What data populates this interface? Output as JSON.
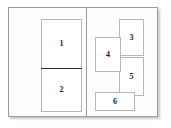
{
  "diagram": {
    "type": "layout-wireframe",
    "title": "",
    "frame": {
      "name": "window-frame",
      "border_color": "#9c9c9c",
      "background_color": "#fdfdfd",
      "shadow_color": "rgba(0,0,0,0.22)"
    },
    "divider": {
      "name": "panel-divider",
      "orientation": "vertical",
      "color": "#9c9c9c"
    },
    "panels": [
      {
        "name": "left-panel",
        "regions": [
          {
            "id": "r1",
            "label": "1"
          },
          {
            "id": "r2",
            "label": "2"
          }
        ],
        "internal_rule": {
          "name": "stack-rule",
          "orientation": "horizontal",
          "color": "#2b2b2b"
        }
      },
      {
        "name": "right-panel",
        "regions": [
          {
            "id": "r3",
            "label": "3"
          },
          {
            "id": "r4",
            "label": "4"
          },
          {
            "id": "r5",
            "label": "5"
          },
          {
            "id": "r6",
            "label": "6"
          }
        ]
      }
    ],
    "region_style": {
      "border_color": "#b6b6b6",
      "fill_color": "#ffffff",
      "label_color": "#1d1d1d"
    }
  }
}
